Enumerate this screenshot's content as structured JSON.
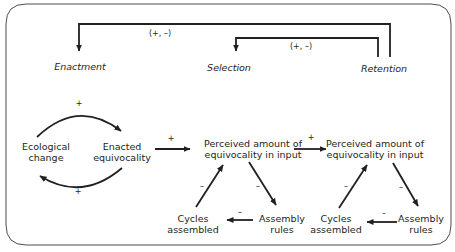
{
  "diagram": {
    "stages": [
      {
        "id": "enactment",
        "label": "Enactment"
      },
      {
        "id": "selection",
        "label": "Selection"
      },
      {
        "id": "retention",
        "label": "Retention"
      }
    ],
    "feedback_labels": {
      "retention_to_enactment": "(+, –)",
      "retention_to_selection": "(+, –)"
    },
    "nodes": {
      "ecological_change": [
        "Ecological",
        "change"
      ],
      "enacted_equivocality": [
        "Enacted",
        "equivocality"
      ],
      "perceived_1": [
        "Perceived amount of",
        "equivocality in input"
      ],
      "perceived_2": [
        "Perceived amount of",
        "equivocality in input"
      ],
      "cycles_1": [
        "Cycles",
        "assembled"
      ],
      "rules_1": [
        "Assembly",
        "rules"
      ],
      "cycles_2": [
        "Cycles",
        "assembled"
      ],
      "rules_2": [
        "Assembly",
        "rules"
      ]
    },
    "signs": {
      "loop_top": "+",
      "loop_bottom": "+",
      "enacted_to_perceived": "+",
      "perceived_to_perceived": "+",
      "t1_cycles_to_perceived": "–",
      "t1_perceived_to_rules": "–",
      "t1_rules_to_cycles": "–",
      "t2_cycles_to_perceived": "–",
      "t2_perceived_to_rules": "–",
      "t2_rules_to_cycles": "–"
    },
    "colors": {
      "ink": "#231f20",
      "frame": "#4d4d4d"
    }
  }
}
